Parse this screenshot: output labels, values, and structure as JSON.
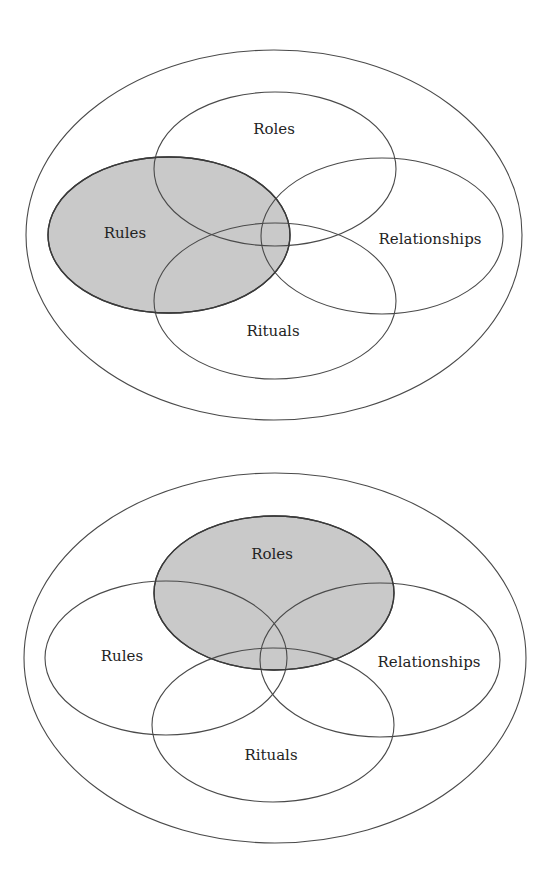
{
  "figures": [
    {
      "id": "top",
      "highlighted": "Rules",
      "labels": {
        "roles": "Roles",
        "rules": "Rules",
        "relationships": "Relationships",
        "rituals": "Rituals"
      }
    },
    {
      "id": "bottom",
      "highlighted": "Roles",
      "labels": {
        "roles": "Roles",
        "rules": "Rules",
        "relationships": "Relationships",
        "rituals": "Rituals"
      }
    }
  ],
  "colors": {
    "highlight_fill": "#c9c9c9",
    "stroke": "#4a4a4a",
    "text": "#232323",
    "background": "#ffffff"
  }
}
